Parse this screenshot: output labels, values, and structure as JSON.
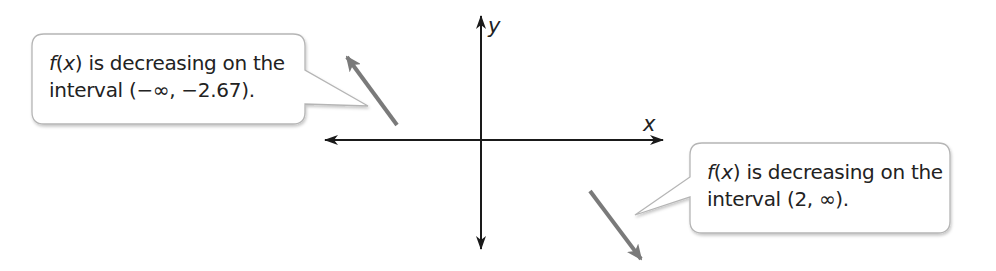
{
  "axes": {
    "x_label": "x",
    "y_label": "y"
  },
  "callouts": [
    {
      "function": "f",
      "variable": "x",
      "line1_rest": " is decreasing on the",
      "line2": "interval (−∞, −2.67)."
    },
    {
      "function": "f",
      "variable": "x",
      "line1_rest": " is decreasing on the",
      "line2": "interval (2, ∞)."
    }
  ],
  "colors": {
    "axis": "#1a1a1a",
    "arrow": "#7a7a7a",
    "callout_border": "#b5b5b5",
    "text": "#222222"
  }
}
